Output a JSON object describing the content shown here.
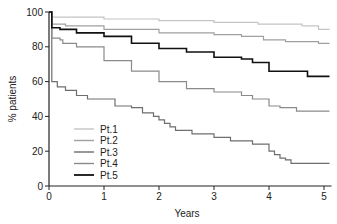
{
  "chart_data": {
    "type": "line",
    "title": "",
    "xlabel": "Years",
    "ylabel": "% patients",
    "xlim": [
      0,
      5.1
    ],
    "ylim": [
      0,
      100
    ],
    "xticks": [
      0,
      1,
      2,
      3,
      4,
      5
    ],
    "yticks": [
      0,
      20,
      40,
      60,
      80,
      100
    ],
    "grid": false,
    "legend_position": "lower-left inside",
    "step": true,
    "series": [
      {
        "name": "Pt.1",
        "color": "#c4c4c4",
        "width": 1.2,
        "x": [
          0,
          0.05,
          0.05,
          1,
          2,
          3,
          3.8,
          4.6,
          4.9,
          5.1
        ],
        "y": [
          100,
          100,
          97,
          96,
          95,
          94,
          93,
          92,
          90,
          90
        ]
      },
      {
        "name": "Pt.2",
        "color": "#a0a0a0",
        "width": 1.2,
        "x": [
          0,
          0.05,
          0.05,
          0.3,
          1,
          2,
          3,
          3.5,
          3.9,
          4.3,
          4.9,
          5.1
        ],
        "y": [
          100,
          100,
          93,
          92,
          90,
          88,
          87,
          86,
          84,
          83,
          82,
          82
        ]
      },
      {
        "name": "Pt.3",
        "color": "#6e6e6e",
        "width": 1.2,
        "x": [
          0,
          0.05,
          0.05,
          0.15,
          0.3,
          0.5,
          0.7,
          1.0,
          1.2,
          1.5,
          1.7,
          1.9,
          2.0,
          2.1,
          2.2,
          2.3,
          2.6,
          3.0,
          3.3,
          3.7,
          4.0,
          4.1,
          4.2,
          4.3,
          4.4,
          4.6,
          5.1
        ],
        "y": [
          100,
          100,
          60,
          57,
          55,
          52,
          50,
          50,
          46,
          45,
          42,
          40,
          38,
          36,
          34,
          32,
          30,
          28,
          26,
          24,
          20,
          18,
          16,
          15,
          13,
          13,
          13
        ]
      },
      {
        "name": "Pt.4",
        "color": "#8a8a8a",
        "width": 1.2,
        "x": [
          0,
          0.05,
          0.05,
          0.2,
          0.25,
          0.5,
          1.0,
          1.5,
          2.0,
          2.5,
          3.0,
          3.5,
          3.7,
          4.0,
          4.2,
          4.5,
          5.1
        ],
        "y": [
          100,
          100,
          85,
          84,
          82,
          80,
          72,
          66,
          60,
          56,
          54,
          52,
          50,
          46,
          45,
          43,
          43
        ]
      },
      {
        "name": "Pt.5",
        "color": "#111111",
        "width": 1.6,
        "x": [
          0,
          0.05,
          0.05,
          0.2,
          0.5,
          1.0,
          1.5,
          2.0,
          2.5,
          3.0,
          3.5,
          3.7,
          4.0,
          4.5,
          4.7,
          5.1
        ],
        "y": [
          100,
          100,
          91,
          90,
          88,
          86,
          82,
          79,
          77,
          74,
          73,
          71,
          66,
          66,
          63,
          63
        ]
      }
    ]
  },
  "axes": {
    "xlabel": "Years",
    "ylabel": "% patients",
    "xtick_labels": [
      "0",
      "1",
      "2",
      "3",
      "4",
      "5"
    ],
    "ytick_labels": [
      "0",
      "20",
      "40",
      "60",
      "80",
      "100"
    ]
  },
  "legend": {
    "items": [
      {
        "label": "Pt.1",
        "color": "#c4c4c4"
      },
      {
        "label": "Pt.2",
        "color": "#a0a0a0"
      },
      {
        "label": "Pt.3",
        "color": "#6e6e6e"
      },
      {
        "label": "Pt.4",
        "color": "#8a8a8a"
      },
      {
        "label": "Pt.5",
        "color": "#111111"
      }
    ]
  }
}
